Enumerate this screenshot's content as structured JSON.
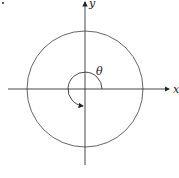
{
  "diagram": {
    "x_axis_label": "x",
    "y_axis_label": "y",
    "angle_label": "θ",
    "colors": {
      "stroke": "#333333",
      "circle": "#555555"
    }
  }
}
